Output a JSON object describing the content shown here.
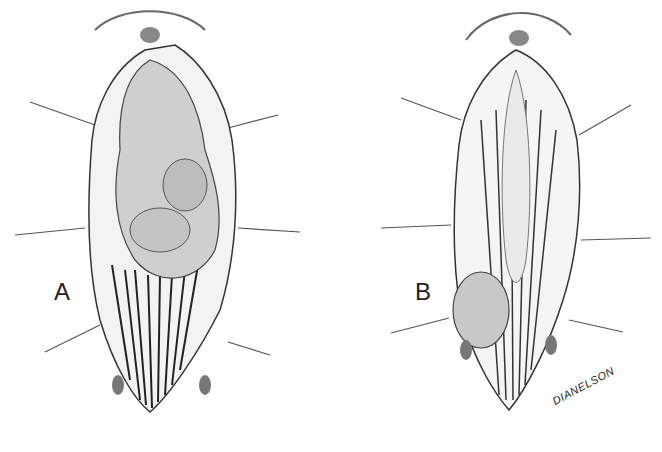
{
  "figure": {
    "panels": [
      {
        "label": "A",
        "description": "Surgical exposure with large lobulated mass over muscle fibers, retracted wound edges"
      },
      {
        "label": "B",
        "description": "Surgical exposure with small rounded mass at lower left of exposed tissue"
      }
    ],
    "signature": "DIANELSON"
  }
}
